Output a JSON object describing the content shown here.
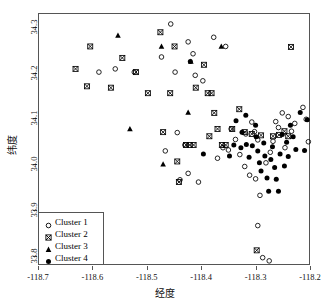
{
  "chart_data": {
    "type": "scatter",
    "title": "",
    "xlabel": "经度",
    "ylabel": "纬度",
    "xlim": [
      -118.7,
      -118.2
    ],
    "ylim": [
      33.78,
      34.33
    ],
    "xticks": [
      -118.7,
      -118.6,
      -118.5,
      -118.4,
      -118.3,
      -118.2
    ],
    "xticklabels": [
      "-118.7",
      "-118.6",
      "-118.5",
      "-118.4",
      "-118.3",
      "-118.2"
    ],
    "yticks": [
      33.8,
      33.9,
      34.0,
      34.1,
      34.2,
      34.3
    ],
    "yticklabels": [
      "33.8",
      "33.9",
      "34.0",
      "34.1",
      "34.2",
      "34.3"
    ],
    "grid": false,
    "legend_position": "bottom-left",
    "series": [
      {
        "name": "Cluster 1",
        "marker": "open-circle",
        "color": "#000000",
        "points": [
          [
            -118.588,
            34.201
          ],
          [
            -118.558,
            34.208
          ],
          [
            -118.523,
            34.201
          ],
          [
            -118.473,
            34.234
          ],
          [
            -118.456,
            34.306
          ],
          [
            -118.448,
            34.201
          ],
          [
            -118.424,
            34.267
          ],
          [
            -118.415,
            34.241
          ],
          [
            -118.411,
            34.194
          ],
          [
            -118.397,
            34.182
          ],
          [
            -118.377,
            34.277
          ],
          [
            -118.355,
            34.257
          ],
          [
            -118.444,
            34.069
          ],
          [
            -118.466,
            34.029
          ],
          [
            -118.43,
            34.042
          ],
          [
            -118.424,
            33.98
          ],
          [
            -118.439,
            33.966
          ],
          [
            -118.405,
            33.961
          ],
          [
            -118.345,
            34.077
          ],
          [
            -118.337,
            34.054
          ],
          [
            -118.329,
            34.021
          ],
          [
            -118.318,
            34.066
          ],
          [
            -118.307,
            34.092
          ],
          [
            -118.302,
            34.071
          ],
          [
            -118.296,
            34.053
          ],
          [
            -118.32,
            33.995
          ],
          [
            -118.311,
            33.976
          ],
          [
            -118.3,
            33.968
          ],
          [
            -118.292,
            33.932
          ],
          [
            -118.281,
            34.003
          ],
          [
            -118.273,
            34.026
          ],
          [
            -118.268,
            34.05
          ],
          [
            -118.263,
            34.093
          ],
          [
            -118.258,
            34.08
          ],
          [
            -118.251,
            34.112
          ],
          [
            -118.246,
            34.036
          ],
          [
            -118.24,
            34.104
          ],
          [
            -118.234,
            34.072
          ],
          [
            -118.228,
            34.089
          ],
          [
            -118.213,
            34.124
          ],
          [
            -118.207,
            34.098
          ],
          [
            -118.203,
            34.049
          ],
          [
            -118.296,
            33.866
          ],
          [
            -118.287,
            33.796
          ],
          [
            -118.275,
            33.789
          ],
          [
            -118.37,
            34.013
          ],
          [
            -118.36,
            34.036
          ],
          [
            -118.35,
            34.031
          ]
        ]
      },
      {
        "name": "Cluster 2",
        "marker": "crossed-square",
        "color": "#000000",
        "points": [
          [
            -118.631,
            34.208
          ],
          [
            -118.61,
            34.17
          ],
          [
            -118.604,
            34.257
          ],
          [
            -118.566,
            34.167
          ],
          [
            -118.545,
            34.232
          ],
          [
            -118.52,
            34.201
          ],
          [
            -118.498,
            34.155
          ],
          [
            -118.475,
            34.288
          ],
          [
            -118.47,
            34.07
          ],
          [
            -118.457,
            34.155
          ],
          [
            -118.449,
            34.257
          ],
          [
            -118.444,
            34.006
          ],
          [
            -118.441,
            33.961
          ],
          [
            -118.428,
            34.042
          ],
          [
            -118.421,
            34.042
          ],
          [
            -118.414,
            34.042
          ],
          [
            -118.41,
            34.167
          ],
          [
            -118.395,
            34.217
          ],
          [
            -118.388,
            34.155
          ],
          [
            -118.385,
            34.061
          ],
          [
            -118.381,
            34.155
          ],
          [
            -118.376,
            34.112
          ],
          [
            -118.37,
            34.077
          ],
          [
            -118.362,
            34.042
          ],
          [
            -118.355,
            34.042
          ],
          [
            -118.343,
            34.077
          ],
          [
            -118.33,
            34.12
          ],
          [
            -118.32,
            34.07
          ],
          [
            -118.307,
            34.066
          ],
          [
            -118.29,
            34.063
          ],
          [
            -118.268,
            34.061
          ],
          [
            -118.257,
            34.064
          ],
          [
            -118.247,
            34.072
          ],
          [
            -118.24,
            34.061
          ],
          [
            -118.235,
            34.256
          ],
          [
            -118.298,
            33.812
          ]
        ]
      },
      {
        "name": "Cluster 3",
        "marker": "filled-triangle",
        "color": "#000000",
        "points": [
          [
            -118.553,
            34.281
          ],
          [
            -118.531,
            34.077
          ],
          [
            -118.473,
            34.257
          ],
          [
            -118.47,
            34.0
          ],
          [
            -118.424,
            34.113
          ],
          [
            -118.419,
            34.224
          ],
          [
            -118.363,
            34.257
          ]
        ]
      },
      {
        "name": "Cluster 4",
        "marker": "filled-circle",
        "color": "#000000",
        "points": [
          [
            -118.42,
            34.224
          ],
          [
            -118.396,
            34.022
          ],
          [
            -118.336,
            34.095
          ],
          [
            -118.325,
            34.07
          ],
          [
            -118.327,
            34.036
          ],
          [
            -118.317,
            34.043
          ],
          [
            -118.312,
            34.015
          ],
          [
            -118.306,
            34.04
          ],
          [
            -118.3,
            34.085
          ],
          [
            -118.299,
            34.06
          ],
          [
            -118.296,
            34.029
          ],
          [
            -118.293,
            34.003
          ],
          [
            -118.29,
            33.985
          ],
          [
            -118.285,
            34.046
          ],
          [
            -118.283,
            34.018
          ],
          [
            -118.279,
            33.97
          ],
          [
            -118.276,
            33.941
          ],
          [
            -118.272,
            34.01
          ],
          [
            -118.269,
            34.038
          ],
          [
            -118.265,
            33.993
          ],
          [
            -118.262,
            33.967
          ],
          [
            -118.258,
            33.941
          ],
          [
            -118.255,
            34.022
          ],
          [
            -118.251,
            34.065
          ],
          [
            -118.247,
            33.996
          ],
          [
            -118.243,
            34.048
          ],
          [
            -118.24,
            34.017
          ],
          [
            -118.236,
            34.085
          ],
          [
            -118.231,
            34.06
          ],
          [
            -118.226,
            34.032
          ],
          [
            -118.218,
            34.113
          ],
          [
            -118.21,
            34.03
          ],
          [
            -118.205,
            34.097
          ],
          [
            -118.34,
            34.042
          ],
          [
            -118.318,
            34.107
          ],
          [
            -118.348,
            34.018
          ]
        ]
      }
    ]
  }
}
